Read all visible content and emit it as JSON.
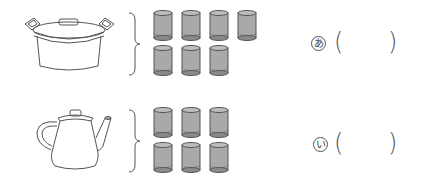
{
  "problems": [
    {
      "container": "pot",
      "container_icon": "pot-icon",
      "cup_count": 7,
      "cup_rows": [
        4,
        3
      ],
      "label": "あ",
      "answer": ""
    },
    {
      "container": "teapot",
      "container_icon": "teapot-icon",
      "cup_count": 6,
      "cup_rows": [
        3,
        3
      ],
      "label": "い",
      "answer": ""
    }
  ],
  "colors": {
    "line": "#555555",
    "cup_fill": "#a9a9a9",
    "cup_dark": "#6e6e6e"
  }
}
